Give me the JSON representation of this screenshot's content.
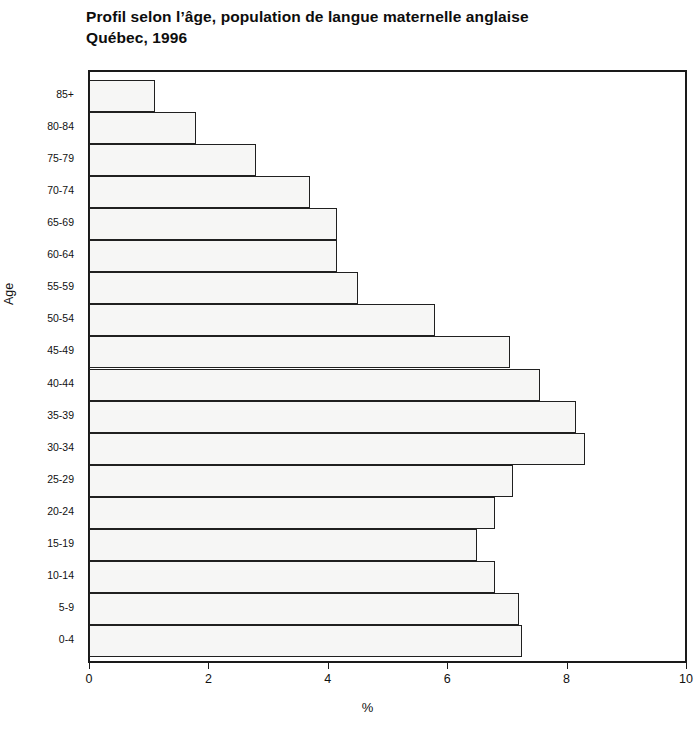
{
  "chart_data": {
    "type": "bar",
    "orientation": "horizontal",
    "title_lines": [
      "Profil selon l’âge, population de langue maternelle anglaise",
      "Québec, 1996"
    ],
    "xlabel": "%",
    "ylabel": "Age",
    "xlim": [
      0,
      10
    ],
    "xticks": [
      0,
      2,
      4,
      6,
      8,
      10
    ],
    "xtick_labels": [
      "0",
      "2",
      "4",
      "6",
      "8",
      "10"
    ],
    "grid": false,
    "legend": null,
    "bar_style": {
      "fill": "#f6f6f5",
      "border": "#202020"
    },
    "categories": [
      "0-4",
      "5-9",
      "10-14",
      "15-19",
      "20-24",
      "25-29",
      "30-34",
      "35-39",
      "40-44",
      "45-49",
      "50-54",
      "55-59",
      "60-64",
      "65-69",
      "70-74",
      "75-79",
      "80-84",
      "85+"
    ],
    "values": [
      7.25,
      7.2,
      6.8,
      6.5,
      6.8,
      7.1,
      8.3,
      8.15,
      7.55,
      7.05,
      5.8,
      4.5,
      4.15,
      4.15,
      3.7,
      2.8,
      1.8,
      1.1
    ]
  }
}
